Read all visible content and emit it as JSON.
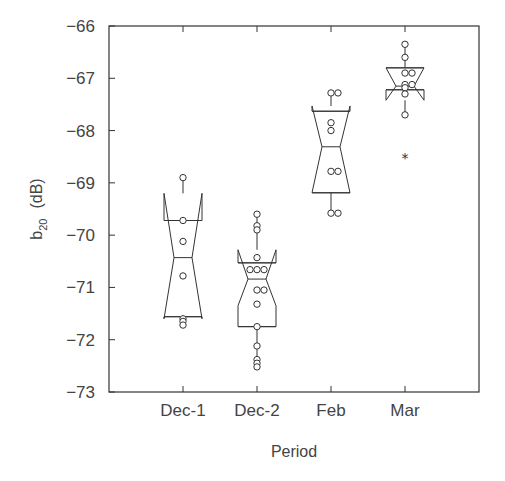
{
  "chart_data": {
    "type": "notched-box",
    "title": "",
    "xlabel": "Period",
    "ylabel": "b20 (dB)",
    "ylabel_main": "b",
    "ylabel_sub": "20",
    "ylabel_unit": "(dB)",
    "ylim": [
      -73,
      -66
    ],
    "yticks": [
      -66,
      -67,
      -68,
      -69,
      -70,
      -71,
      -72,
      -73
    ],
    "grid": false,
    "legend": null,
    "categories": [
      "Dec-1",
      "Dec-2",
      "Feb",
      "Mar"
    ],
    "series": [
      {
        "name": "Dec-1",
        "whisker_high": -68.9,
        "q3": -69.72,
        "notch_high": -69.2,
        "median": -70.43,
        "notch_low": -71.6,
        "q1": -71.56,
        "whisker_low": -71.7,
        "points": [
          -68.9,
          -69.72,
          -70.12,
          -70.78,
          -71.6,
          -71.65,
          -71.72
        ],
        "outliers": []
      },
      {
        "name": "Dec-2",
        "whisker_high": -69.6,
        "q3": -70.53,
        "notch_high": -70.28,
        "median": -70.84,
        "notch_low": -71.35,
        "q1": -71.75,
        "whisker_low": -72.5,
        "points": [
          -69.6,
          -69.82,
          -69.9,
          -70.43,
          -70.66,
          -70.66,
          -70.66,
          -71.05,
          -71.05,
          -71.32,
          -71.75,
          -72.12,
          -72.38,
          -72.45,
          -72.52
        ],
        "outliers": []
      },
      {
        "name": "Feb",
        "whisker_high": -67.28,
        "q3": -67.63,
        "notch_high": -67.53,
        "median": -68.31,
        "notch_low": -69.19,
        "q1": -69.19,
        "whisker_low": -69.58,
        "points": [
          -67.28,
          -67.28,
          -67.85,
          -68.0,
          -68.78,
          -68.78,
          -69.58,
          -69.58
        ],
        "outliers": []
      },
      {
        "name": "Mar",
        "whisker_high": -66.35,
        "q3": -66.8,
        "notch_high": -66.8,
        "median": -67.15,
        "notch_low": -67.42,
        "q1": -67.22,
        "whisker_low": -67.7,
        "points": [
          -66.35,
          -66.6,
          -66.9,
          -66.9,
          -67.12,
          -67.12,
          -67.18,
          -67.3,
          -67.7
        ],
        "outliers": [
          -68.5
        ]
      }
    ]
  }
}
